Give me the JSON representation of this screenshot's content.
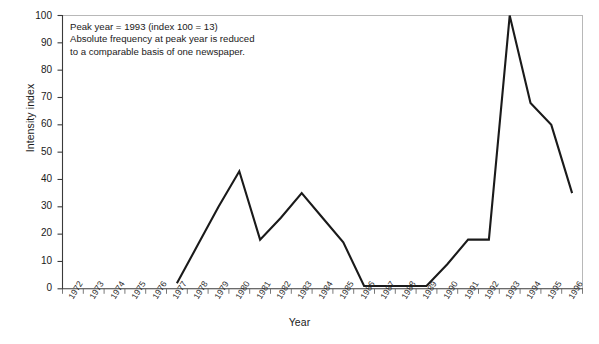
{
  "chart_data": {
    "type": "line",
    "title": "",
    "xlabel": "Year",
    "ylabel": "Intensity index",
    "xlim": [
      1972,
      1996
    ],
    "ylim": [
      0,
      100
    ],
    "grid": false,
    "legend": "none",
    "line_color": "#1a1a1a",
    "categories": [
      "1972",
      "1973",
      "1974",
      "1975",
      "1976",
      "1977",
      "1978",
      "1979",
      "1980",
      "1981",
      "1982",
      "1983",
      "1984",
      "1985",
      "1986",
      "1987",
      "1988",
      "1989",
      "1990",
      "1991",
      "1992",
      "1993",
      "1994",
      "1995",
      "1996"
    ],
    "x": [
      1972,
      1973,
      1974,
      1975,
      1976,
      1977,
      1978,
      1979,
      1980,
      1981,
      1982,
      1983,
      1984,
      1985,
      1986,
      1987,
      1988,
      1989,
      1990,
      1991,
      1992,
      1993,
      1994,
      1995,
      1996
    ],
    "values": [
      null,
      null,
      null,
      null,
      null,
      2,
      16,
      30,
      43,
      18,
      26,
      35,
      26,
      17,
      1,
      1,
      1,
      1,
      9,
      18,
      18,
      100,
      68,
      60,
      35
    ],
    "series": [
      {
        "name": "Intensity index",
        "values": [
          null,
          null,
          null,
          null,
          null,
          2,
          16,
          30,
          43,
          18,
          26,
          35,
          26,
          17,
          1,
          1,
          1,
          1,
          9,
          18,
          18,
          100,
          68,
          60,
          35
        ]
      }
    ],
    "ytick_labels": [
      "0",
      "10",
      "20",
      "30",
      "40",
      "50",
      "60",
      "70",
      "80",
      "90",
      "100"
    ],
    "ytick_values": [
      0,
      10,
      20,
      30,
      40,
      50,
      60,
      70,
      80,
      90,
      100
    ],
    "annotations": [
      {
        "name": "peak-note",
        "text": "Peak year = 1993 (index 100 = 13)\nAbsolute frequency at peak year is reduced\nto a comparable basis of one newspaper."
      }
    ]
  }
}
